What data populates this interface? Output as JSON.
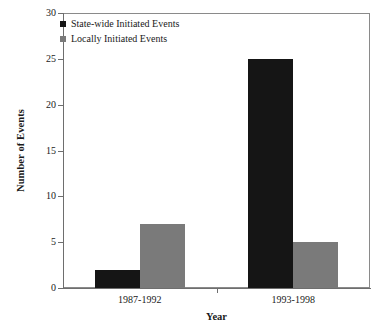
{
  "chart_data": {
    "type": "bar",
    "title": "",
    "subtitle": "",
    "xlabel": "Year",
    "ylabel": "Number of Events",
    "categories": [
      "1987-1992",
      "1993-1998"
    ],
    "series": [
      {
        "name": "State-wide Initiated Events",
        "color": "#151515",
        "values": [
          2,
          25
        ]
      },
      {
        "name": "Locally Initiated Events",
        "color": "#7a7a7a",
        "values": [
          7,
          5
        ]
      }
    ],
    "ylim": [
      0,
      30
    ],
    "yticks": [
      0,
      5,
      10,
      15,
      20,
      25,
      30
    ],
    "ytick_labels": [
      "0",
      "5",
      "10",
      "15",
      "20",
      "25",
      "30"
    ],
    "grid": false,
    "legend_position": "top-left",
    "axis_color": "#6e6e6e",
    "background": "#ffffff"
  },
  "legend": {
    "items": [
      {
        "label": "State-wide Initiated Events",
        "swatch": "legend-swatch-black"
      },
      {
        "label": "Locally Initiated Events",
        "swatch": "legend-swatch-gray"
      }
    ]
  }
}
